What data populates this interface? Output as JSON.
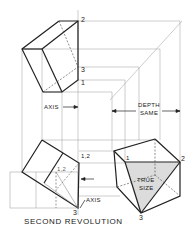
{
  "figure": {
    "title": "SECOND REVOLUTION",
    "labels": {
      "axis_top": "AXIS",
      "axis_bottom": "AXIS",
      "depth_line1": "DEPTH",
      "depth_line2": "SAME",
      "true_line1": "TRUE",
      "true_line2": "SIZE"
    },
    "point_labels": {
      "top_2": "2",
      "top_3": "3",
      "top_1": "1",
      "bl_12_outer": "1,2",
      "bl_12_inner": "1,2",
      "bl_3": "3",
      "br_1": "1",
      "br_2": "2",
      "br_3": "3"
    },
    "colors": {
      "line": "#222222",
      "thin": "#888888",
      "shade": "#d9d9d9"
    }
  }
}
